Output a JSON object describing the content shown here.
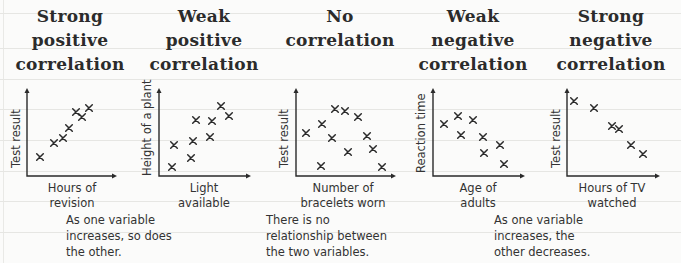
{
  "chart_data": [
    {
      "type": "scatter",
      "title": "Strong positive correlation",
      "xlabel": "Hours of revision",
      "ylabel": "Test result",
      "axis": {
        "origin": [
          27,
          176
        ],
        "x_end": 117,
        "y_top": 88
      },
      "points": [
        [
          40,
          157
        ],
        [
          54,
          143
        ],
        [
          63,
          138
        ],
        [
          69,
          128
        ],
        [
          76,
          112
        ],
        [
          82,
          117
        ],
        [
          89,
          108
        ]
      ]
    },
    {
      "type": "scatter",
      "title": "Weak positive correlation",
      "xlabel": "Light available",
      "ylabel": "Height of a plant",
      "axis": {
        "origin": [
          159,
          176
        ],
        "x_end": 251,
        "y_top": 88
      },
      "points": [
        [
          172,
          167
        ],
        [
          174,
          145
        ],
        [
          191,
          158
        ],
        [
          193,
          141
        ],
        [
          196,
          120
        ],
        [
          210,
          137
        ],
        [
          212,
          121
        ],
        [
          221,
          106
        ],
        [
          229,
          116
        ]
      ]
    },
    {
      "type": "scatter",
      "title": "No correlation",
      "xlabel": "Number of bracelets worn",
      "ylabel": "Test result",
      "axis": {
        "origin": [
          296,
          176
        ],
        "x_end": 396,
        "y_top": 88
      },
      "points": [
        [
          306,
          133
        ],
        [
          322,
          124
        ],
        [
          335,
          109
        ],
        [
          345,
          111
        ],
        [
          358,
          117
        ],
        [
          332,
          138
        ],
        [
          367,
          136
        ],
        [
          348,
          152
        ],
        [
          373,
          149
        ],
        [
          321,
          166
        ],
        [
          382,
          167
        ]
      ]
    },
    {
      "type": "scatter",
      "title": "Weak negative correlation",
      "xlabel": "Age of adults",
      "ylabel": "Reaction time",
      "axis": {
        "origin": [
          433,
          176
        ],
        "x_end": 525,
        "y_top": 88
      },
      "points": [
        [
          444,
          124
        ],
        [
          458,
          116
        ],
        [
          473,
          120
        ],
        [
          461,
          135
        ],
        [
          483,
          137
        ],
        [
          484,
          153
        ],
        [
          500,
          145
        ],
        [
          504,
          164
        ]
      ]
    },
    {
      "type": "scatter",
      "title": "Strong negative correlation",
      "xlabel": "Hours of TV watched",
      "ylabel": "Test result",
      "axis": {
        "origin": [
          567,
          176
        ],
        "x_end": 660,
        "y_top": 88
      },
      "points": [
        [
          574,
          101
        ],
        [
          594,
          108
        ],
        [
          612,
          126
        ],
        [
          619,
          129
        ],
        [
          631,
          145
        ],
        [
          643,
          154
        ]
      ]
    }
  ],
  "titles": [
    {
      "lines": [
        "Strong",
        "positive",
        "correlation"
      ]
    },
    {
      "lines": [
        "Weak",
        "positive",
        "correlation"
      ]
    },
    {
      "lines": [
        "No",
        "correlation"
      ]
    },
    {
      "lines": [
        "Weak",
        "negative",
        "correlation"
      ]
    },
    {
      "lines": [
        "Strong",
        "negative",
        "correlation"
      ]
    }
  ],
  "xlabels": [
    [
      "Hours of",
      "revision"
    ],
    [
      "Light",
      "available"
    ],
    [
      "Number of",
      "bracelets worn"
    ],
    [
      "Age of",
      "adults"
    ],
    [
      "Hours of TV",
      "watched"
    ]
  ],
  "ylabels": [
    "Test result",
    "Height of a plant",
    "Test result",
    "Reaction time",
    "Test result"
  ],
  "captions": {
    "positive": [
      "As one variable",
      "increases, so does",
      "the other."
    ],
    "none": [
      "There is no",
      "relationship between",
      "the two variables."
    ],
    "negative": [
      "As one variable",
      "increases, the",
      "other decreases."
    ]
  },
  "colors": {
    "ink": "#2a2a2a",
    "paper": "#fbfbfa",
    "rule": "#e6e6e3"
  }
}
